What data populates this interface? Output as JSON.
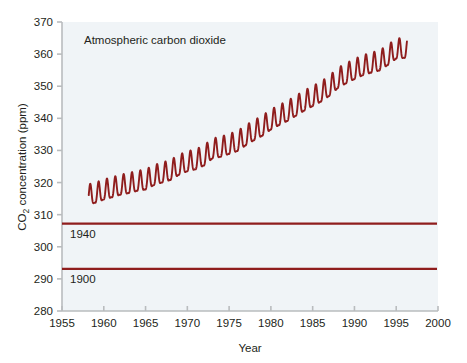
{
  "chart_data": {
    "type": "line",
    "title": "Atmospheric carbon dioxide",
    "xlabel": "Year",
    "ylabel": "CO2 concentration (ppm)",
    "ylabel_prefix": "CO",
    "ylabel_subscript": "2",
    "ylabel_suffix": " concentration (ppm)",
    "xlim": [
      1955,
      2000
    ],
    "ylim": [
      280,
      370
    ],
    "xticks": [
      1955,
      1960,
      1965,
      1970,
      1975,
      1980,
      1985,
      1990,
      1995,
      2000
    ],
    "yticks": [
      280,
      290,
      300,
      310,
      320,
      330,
      340,
      350,
      360,
      370
    ],
    "grid": false,
    "legend": "none",
    "series": [
      {
        "name": "Mauna Loa monthly mean CO2",
        "description": "Keeling curve: rising annual trend with seasonal sawtooth oscillation of about +/- 3 ppm",
        "line_color": "#8f1d1d",
        "x_start": 1958.2,
        "x_end": 1996.3,
        "seasonal_amplitude_ppm": 3.1,
        "annual_means": [
          {
            "year": 1958,
            "value": 315.3
          },
          {
            "year": 1959,
            "value": 315.9
          },
          {
            "year": 1960,
            "value": 316.9
          },
          {
            "year": 1961,
            "value": 317.6
          },
          {
            "year": 1962,
            "value": 318.4
          },
          {
            "year": 1963,
            "value": 318.9
          },
          {
            "year": 1964,
            "value": 319.6
          },
          {
            "year": 1965,
            "value": 320.0
          },
          {
            "year": 1966,
            "value": 321.4
          },
          {
            "year": 1967,
            "value": 322.2
          },
          {
            "year": 1968,
            "value": 323.0
          },
          {
            "year": 1969,
            "value": 324.6
          },
          {
            "year": 1970,
            "value": 325.7
          },
          {
            "year": 1971,
            "value": 326.3
          },
          {
            "year": 1972,
            "value": 327.5
          },
          {
            "year": 1973,
            "value": 329.7
          },
          {
            "year": 1974,
            "value": 330.2
          },
          {
            "year": 1975,
            "value": 331.1
          },
          {
            "year": 1976,
            "value": 332.0
          },
          {
            "year": 1977,
            "value": 333.8
          },
          {
            "year": 1978,
            "value": 335.4
          },
          {
            "year": 1979,
            "value": 336.8
          },
          {
            "year": 1980,
            "value": 338.7
          },
          {
            "year": 1981,
            "value": 340.1
          },
          {
            "year": 1982,
            "value": 341.4
          },
          {
            "year": 1983,
            "value": 343.0
          },
          {
            "year": 1984,
            "value": 344.6
          },
          {
            "year": 1985,
            "value": 346.0
          },
          {
            "year": 1986,
            "value": 347.4
          },
          {
            "year": 1987,
            "value": 349.2
          },
          {
            "year": 1988,
            "value": 351.6
          },
          {
            "year": 1989,
            "value": 353.1
          },
          {
            "year": 1990,
            "value": 354.4
          },
          {
            "year": 1991,
            "value": 355.6
          },
          {
            "year": 1992,
            "value": 356.4
          },
          {
            "year": 1993,
            "value": 357.1
          },
          {
            "year": 1994,
            "value": 358.8
          },
          {
            "year": 1995,
            "value": 360.8
          },
          {
            "year": 1996,
            "value": 361.0
          }
        ]
      }
    ],
    "reference_lines": [
      {
        "label": "1940",
        "value": 307.2,
        "color": "#8f1d1d"
      },
      {
        "label": "1900",
        "value": 293.1,
        "color": "#8f1d1d"
      }
    ],
    "colors": {
      "plot_background": "#f0f4f7",
      "page_background": "#ffffff",
      "axis": "#b9bcbe",
      "text": "#231f20",
      "data_line": "#8f1d1d"
    }
  }
}
